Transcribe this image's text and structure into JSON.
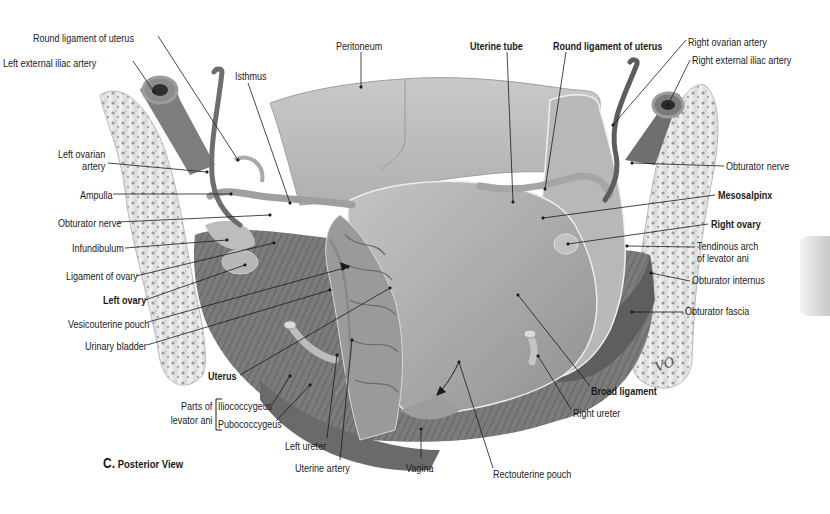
{
  "figure": {
    "caption_letter": "C.",
    "caption_text": "Posterior View",
    "signature": "VO",
    "colors": {
      "background": "#ffffff",
      "tissue_light": "#cfcfcf",
      "tissue_mid": "#a9a9a9",
      "tissue_dark": "#6e6e6e",
      "vessel": "#7a7a7a",
      "bone": "#e6e6e6",
      "text": "#1a1a1a"
    }
  },
  "labels": [
    {
      "id": "round-ligament-left",
      "text": "Round ligament of uterus",
      "bold": false,
      "x": 33,
      "y": 32,
      "line": [
        [
          158,
          36
        ],
        [
          238,
          160
        ]
      ]
    },
    {
      "id": "left-external-iliac-artery",
      "text": "Left external iliac artery",
      "bold": false,
      "x": 3,
      "y": 57,
      "line": [
        [
          133,
          61
        ],
        [
          154,
          92
        ]
      ]
    },
    {
      "id": "isthmus",
      "text": "Isthmus",
      "bold": false,
      "x": 235,
      "y": 70,
      "line": [
        [
          248,
          83
        ],
        [
          290,
          203
        ]
      ]
    },
    {
      "id": "peritoneum",
      "text": "Peritoneum",
      "bold": false,
      "x": 336,
      "y": 40,
      "line": [
        [
          361,
          52
        ],
        [
          361,
          87
        ]
      ]
    },
    {
      "id": "uterine-tube",
      "text": "Uterine tube",
      "bold": true,
      "x": 470,
      "y": 40,
      "line": [
        [
          507,
          52
        ],
        [
          513,
          202
        ]
      ]
    },
    {
      "id": "round-ligament-right",
      "text": "Round ligament of uterus",
      "bold": true,
      "x": 553,
      "y": 40,
      "line": [
        [
          566,
          52
        ],
        [
          545,
          189
        ]
      ]
    },
    {
      "id": "right-ovarian-artery",
      "text": "Right ovarian artery",
      "bold": false,
      "x": 688,
      "y": 36,
      "line": [
        [
          686,
          40
        ],
        [
          613,
          125
        ]
      ]
    },
    {
      "id": "right-external-iliac-artery",
      "text": "Right external iliac artery",
      "bold": false,
      "x": 692,
      "y": 54,
      "line": [
        [
          690,
          60
        ],
        [
          668,
          105
        ]
      ]
    },
    {
      "id": "left-ovarian-artery",
      "text": "Left ovarian\nartery",
      "bold": false,
      "x": 58,
      "y": 148,
      "line": [
        [
          108,
          163
        ],
        [
          207,
          172
        ]
      ]
    },
    {
      "id": "ampulla",
      "text": "Ampulla",
      "bold": false,
      "x": 80,
      "y": 189,
      "line": [
        [
          113,
          194
        ],
        [
          231,
          194
        ]
      ]
    },
    {
      "id": "obturator-nerve-left",
      "text": "Obturator nerve",
      "bold": false,
      "x": 58,
      "y": 217,
      "line": [
        [
          118,
          222
        ],
        [
          270,
          215
        ]
      ]
    },
    {
      "id": "infundibulum",
      "text": "Infundibulum",
      "bold": false,
      "x": 72,
      "y": 242,
      "line": [
        [
          125,
          248
        ],
        [
          227,
          240
        ]
      ]
    },
    {
      "id": "ligament-of-ovary",
      "text": "Ligament of ovary",
      "bold": false,
      "x": 66,
      "y": 270,
      "line": [
        [
          136,
          276
        ],
        [
          274,
          243
        ]
      ]
    },
    {
      "id": "left-ovary",
      "text": "Left ovary",
      "bold": true,
      "x": 103,
      "y": 294,
      "line": [
        [
          145,
          300
        ],
        [
          245,
          265
        ]
      ]
    },
    {
      "id": "vesicouterine-pouch",
      "text": "Vesicouterine pouch",
      "bold": false,
      "x": 68,
      "y": 318,
      "line": [
        [
          148,
          322
        ],
        [
          348,
          267
        ]
      ]
    },
    {
      "id": "urinary-bladder",
      "text": "Urinary bladder",
      "bold": false,
      "x": 85,
      "y": 340,
      "line": [
        [
          147,
          345
        ],
        [
          330,
          290
        ]
      ]
    },
    {
      "id": "uterus",
      "text": "Uterus",
      "bold": true,
      "x": 208,
      "y": 370,
      "line": [
        [
          240,
          375
        ],
        [
          390,
          288
        ]
      ]
    },
    {
      "id": "iliococcygeus",
      "text": "Iliococcygeus",
      "bold": false,
      "x": 218,
      "y": 400,
      "line": [
        [
          272,
          405
        ],
        [
          290,
          376
        ]
      ]
    },
    {
      "id": "pubococcygeus",
      "text": "Pubococcygeus",
      "bold": false,
      "x": 218,
      "y": 418,
      "line": [
        [
          276,
          421
        ],
        [
          310,
          385
        ]
      ]
    },
    {
      "id": "left-ureter",
      "text": "Left ureter",
      "bold": false,
      "x": 285,
      "y": 440,
      "line": [
        [
          327,
          438
        ],
        [
          337,
          355
        ]
      ]
    },
    {
      "id": "uterine-artery",
      "text": "Uterine artery",
      "bold": false,
      "x": 295,
      "y": 462,
      "line": [
        [
          340,
          460
        ],
        [
          352,
          340
        ]
      ]
    },
    {
      "id": "vagina",
      "text": "Vagina",
      "bold": false,
      "x": 406,
      "y": 462,
      "line": [
        [
          421,
          458
        ],
        [
          421,
          429
        ]
      ]
    },
    {
      "id": "rectouterine-pouch",
      "text": "Rectouterine pouch",
      "bold": false,
      "x": 493,
      "y": 468,
      "line": [
        [
          493,
          468
        ],
        [
          459,
          362
        ]
      ]
    },
    {
      "id": "right-ureter",
      "text": "Right ureter",
      "bold": false,
      "x": 573,
      "y": 407,
      "line": [
        [
          571,
          409
        ],
        [
          538,
          356
        ]
      ]
    },
    {
      "id": "broad-ligament",
      "text": "Broad ligament",
      "bold": true,
      "x": 591,
      "y": 385,
      "line": [
        [
          590,
          386
        ],
        [
          518,
          295
        ]
      ]
    },
    {
      "id": "obturator-nerve-right",
      "text": "Obturator nerve",
      "bold": false,
      "x": 726,
      "y": 160,
      "line": [
        [
          724,
          166
        ],
        [
          632,
          163
        ]
      ]
    },
    {
      "id": "mesosalpinx",
      "text": "Mesosalpinx",
      "bold": true,
      "x": 718,
      "y": 189,
      "line": [
        [
          715,
          195
        ],
        [
          543,
          218
        ]
      ]
    },
    {
      "id": "right-ovary",
      "text": "Right ovary",
      "bold": true,
      "x": 711,
      "y": 218,
      "line": [
        [
          708,
          224
        ],
        [
          568,
          244
        ]
      ]
    },
    {
      "id": "tendinous-arch",
      "text": "Tendinous arch\nof levator ani",
      "bold": false,
      "x": 697,
      "y": 240,
      "line": [
        [
          695,
          247
        ],
        [
          627,
          246
        ]
      ]
    },
    {
      "id": "obturator-internus",
      "text": "Obturator internus",
      "bold": false,
      "x": 692,
      "y": 274,
      "line": [
        [
          690,
          281
        ],
        [
          651,
          273
        ]
      ]
    },
    {
      "id": "obturator-fascia",
      "text": "Obturator fascia",
      "bold": false,
      "x": 685,
      "y": 305,
      "line": [
        [
          683,
          312
        ],
        [
          632,
          312
        ]
      ]
    }
  ],
  "bracket": {
    "label_line1": "Parts of",
    "label_line2": "levator ani",
    "x": 162,
    "y": 400
  }
}
